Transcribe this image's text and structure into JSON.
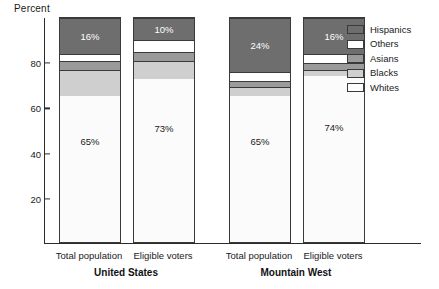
{
  "chart_data": {
    "type": "bar",
    "subtype": "stacked-bar",
    "title": "",
    "ylabel": "Percent",
    "xlabel": "",
    "ylim": [
      0,
      100
    ],
    "yticks": [
      20,
      40,
      60,
      80
    ],
    "grid": false,
    "legend_position": "right",
    "stack_order_bottom_to_top": [
      "Whites",
      "Blacks",
      "Asians",
      "Others",
      "Hispanics"
    ],
    "groups": [
      "United States",
      "Mountain West"
    ],
    "categories": [
      "Total population",
      "Eligible voters",
      "Total population",
      "Eligible voters"
    ],
    "series": [
      {
        "name": "Whites",
        "values": [
          65,
          73,
          65,
          74
        ]
      },
      {
        "name": "Blacks",
        "values": [
          12,
          8,
          4,
          3
        ]
      },
      {
        "name": "Asians",
        "values": [
          4,
          4,
          3,
          3
        ]
      },
      {
        "name": "Others",
        "values": [
          3,
          5,
          4,
          4
        ]
      },
      {
        "name": "Hispanics",
        "values": [
          16,
          10,
          24,
          16
        ]
      }
    ],
    "data_labels": [
      {
        "bar": 0,
        "series": "Whites",
        "text": "65%"
      },
      {
        "bar": 0,
        "series": "Hispanics",
        "text": "16%"
      },
      {
        "bar": 1,
        "series": "Whites",
        "text": "73%"
      },
      {
        "bar": 1,
        "series": "Hispanics",
        "text": "10%"
      },
      {
        "bar": 2,
        "series": "Whites",
        "text": "65%"
      },
      {
        "bar": 2,
        "series": "Hispanics",
        "text": "24%"
      },
      {
        "bar": 3,
        "series": "Whites",
        "text": "74%"
      },
      {
        "bar": 3,
        "series": "Hispanics",
        "text": "16%"
      }
    ],
    "colors": {
      "Hispanics": "#6e6e6e",
      "Others": "#ffffff",
      "Asians": "#9a9a9a",
      "Blacks": "#cfcfcf",
      "Whites": "#fbfbfb",
      "axis": "#2b2b2b",
      "outline": "#3a3a3a"
    }
  },
  "axis": {
    "y_title": "Percent",
    "ticks": [
      "80",
      "60",
      "40",
      "20"
    ]
  },
  "legend": {
    "items": [
      {
        "label": "Hispanics",
        "color": "#6e6e6e"
      },
      {
        "label": "Others",
        "color": "#ffffff"
      },
      {
        "label": "Asians",
        "color": "#9a9a9a"
      },
      {
        "label": "Blacks",
        "color": "#cfcfcf"
      },
      {
        "label": "Whites",
        "color": "#fdfdfd"
      }
    ]
  },
  "xaxis": {
    "categories": [
      {
        "label": "Total population"
      },
      {
        "label": "Eligible voters"
      },
      {
        "label": "Total population"
      },
      {
        "label": "Eligible voters"
      }
    ],
    "groups": [
      {
        "label": "United States"
      },
      {
        "label": "Mountain West"
      }
    ]
  }
}
